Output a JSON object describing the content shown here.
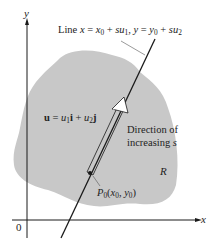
{
  "diagram": {
    "type": "parametric-line-in-region",
    "labels": {
      "line_equation": "Line x = x₀ + su₁, y = y₀ + su₂",
      "line_prefix": "Line",
      "vector": "u = u₁i + u₂j",
      "direction_line1": "Direction of",
      "direction_line2": "increasing s",
      "region": "R",
      "point": "P₀(x₀, y₀)",
      "x_axis": "x",
      "y_axis": "y",
      "origin": "0"
    },
    "colors": {
      "region_fill": "#c8c8c8",
      "line": "#1a1a1a",
      "axis": "#1a1a1a",
      "leader": "#555555",
      "background": "#ffffff"
    }
  }
}
